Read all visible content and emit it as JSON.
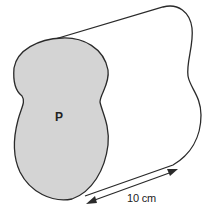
{
  "diagram": {
    "type": "prism",
    "face": {
      "label": "P",
      "fill": "#d4d4d4",
      "stroke": "#2a2a2a"
    },
    "length": {
      "label": "10 cm",
      "value": 10,
      "unit": "cm"
    }
  }
}
